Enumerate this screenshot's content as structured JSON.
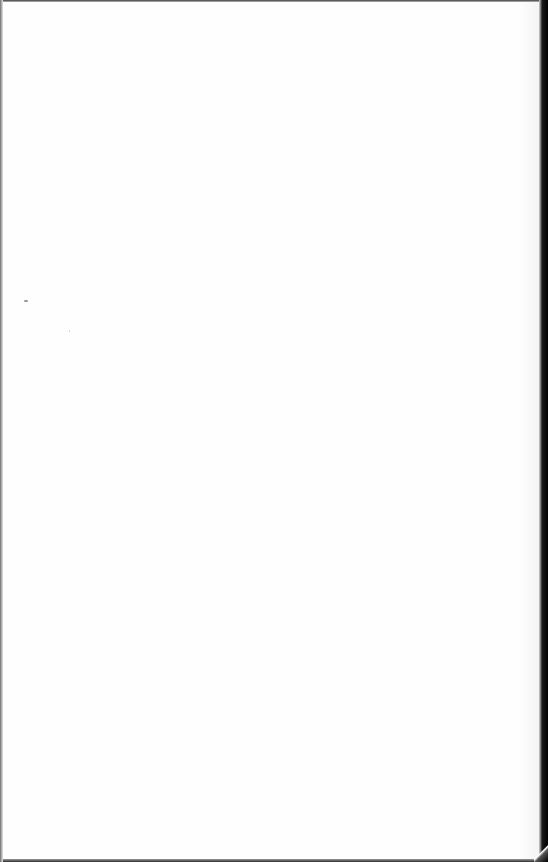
{
  "document": {
    "type": "scanned-page",
    "content": "",
    "colors": {
      "paper": "#fefefe",
      "scanner_border": "#000000"
    }
  }
}
